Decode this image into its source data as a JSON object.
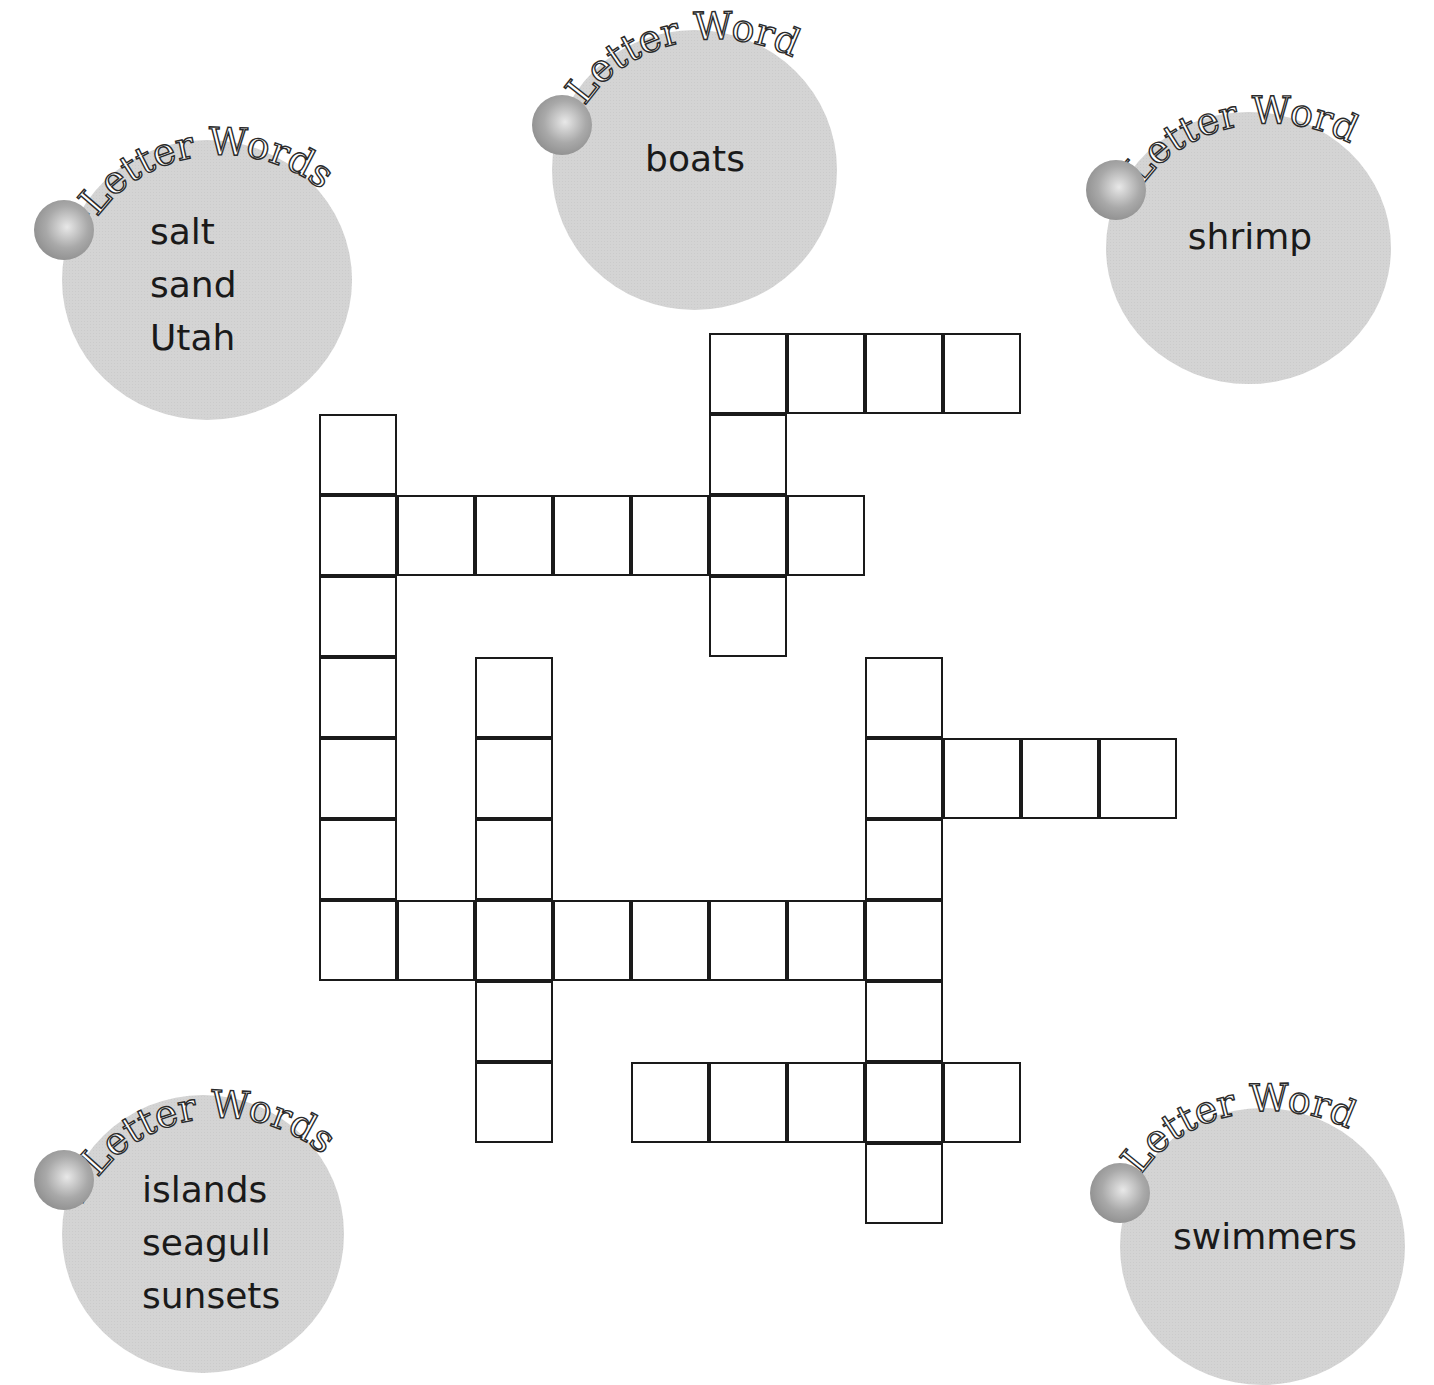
{
  "puzzle": {
    "type": "fill-in crossword",
    "cell_size": {
      "w": 78,
      "h": 81
    },
    "origin": {
      "x": 319,
      "y": 333
    },
    "cells": [
      [
        0,
        5
      ],
      [
        0,
        6
      ],
      [
        0,
        7
      ],
      [
        0,
        8
      ],
      [
        1,
        0
      ],
      [
        1,
        5
      ],
      [
        2,
        0
      ],
      [
        2,
        1
      ],
      [
        2,
        2
      ],
      [
        2,
        3
      ],
      [
        2,
        4
      ],
      [
        2,
        5
      ],
      [
        2,
        6
      ],
      [
        3,
        0
      ],
      [
        3,
        5
      ],
      [
        4,
        0
      ],
      [
        4,
        2
      ],
      [
        4,
        7
      ],
      [
        5,
        0
      ],
      [
        5,
        2
      ],
      [
        5,
        7
      ],
      [
        5,
        8
      ],
      [
        5,
        9
      ],
      [
        5,
        10
      ],
      [
        6,
        0
      ],
      [
        6,
        2
      ],
      [
        6,
        7
      ],
      [
        7,
        0
      ],
      [
        7,
        1
      ],
      [
        7,
        2
      ],
      [
        7,
        3
      ],
      [
        7,
        4
      ],
      [
        7,
        5
      ],
      [
        7,
        6
      ],
      [
        7,
        7
      ],
      [
        8,
        2
      ],
      [
        8,
        7
      ],
      [
        9,
        2
      ],
      [
        9,
        4
      ],
      [
        9,
        5
      ],
      [
        9,
        6
      ],
      [
        9,
        7
      ],
      [
        9,
        8
      ],
      [
        10,
        7
      ]
    ]
  },
  "word_banks": [
    {
      "id": "four",
      "number": "4",
      "label": "-Letter Words",
      "words": [
        "salt",
        "sand",
        "Utah"
      ]
    },
    {
      "id": "five",
      "number": "5",
      "label": "-Letter Word",
      "words": [
        "boats"
      ]
    },
    {
      "id": "six",
      "number": "6",
      "label": "-Letter Word",
      "words": [
        "shrimp"
      ]
    },
    {
      "id": "seven",
      "number": "7",
      "label": "-Letter Words",
      "words": [
        "islands",
        "seagull",
        "sunsets"
      ]
    },
    {
      "id": "eight",
      "number": "8",
      "label": "-Letter Word",
      "words": [
        "swimmers"
      ]
    }
  ],
  "colors": {
    "bubble": "#d4d4d4",
    "grid_line": "#1a1a1a",
    "text": "#1a1a1a"
  }
}
